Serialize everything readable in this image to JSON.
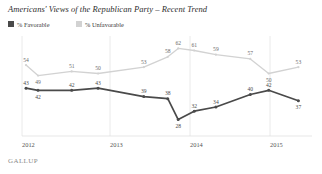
{
  "header": {
    "title": "Americans' Views of the Republican Party – Recent Trend",
    "brand": "GALLUP"
  },
  "legend": {
    "position": "top-left",
    "items": [
      {
        "label": "% Favorable",
        "color": "#4a4a4a"
      },
      {
        "label": "% Unfavorable",
        "color": "#d2d2d2"
      }
    ]
  },
  "axis": {
    "tick_labels": [
      "2012",
      "2013",
      "2014",
      "2015"
    ],
    "tick_positions": [
      22,
      110,
      190,
      270
    ],
    "gridlines": true
  },
  "chart_data": {
    "type": "line",
    "title": "Americans' Views of the Republican Party – Recent Trend",
    "xlabel": "",
    "ylabel": "",
    "ylim": [
      24,
      66
    ],
    "grid": true,
    "legend_position": "top-left",
    "x": [
      2012.05,
      2012.2,
      2012.62,
      2012.95,
      2013.52,
      2013.82,
      2013.95,
      2014.15,
      2014.42,
      2014.85,
      2015.08,
      2015.45
    ],
    "categories": [
      "2012",
      "2012",
      "2012",
      "2012",
      "2013",
      "2013",
      "2013",
      "2014",
      "2014",
      "2014",
      "2015",
      "2015"
    ],
    "series": [
      {
        "name": "% Unfavorable",
        "color": "#d2d2d2",
        "values": [
          54,
          49,
          51,
          50,
          53,
          58,
          62,
          61,
          59,
          57,
          50,
          53
        ]
      },
      {
        "name": "% Favorable",
        "color": "#4a4a4a",
        "values": [
          43,
          42,
          42,
          43,
          39,
          38,
          28,
          32,
          34,
          40,
          42,
          37
        ]
      }
    ]
  }
}
